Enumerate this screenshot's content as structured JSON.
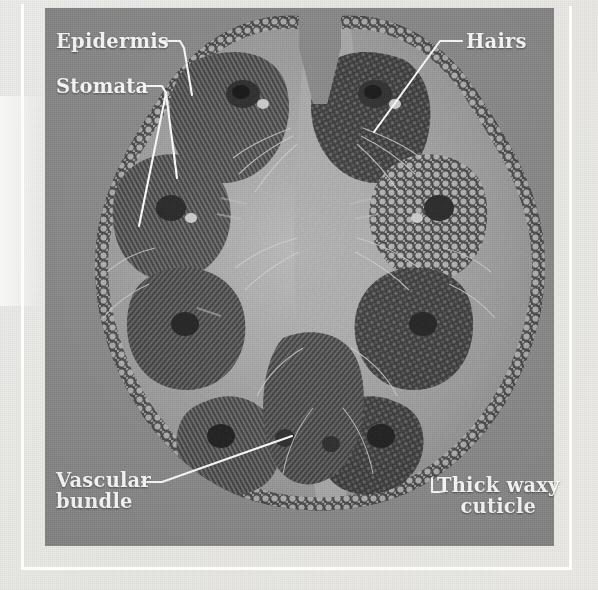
{
  "figure": {
    "medium": "light micrograph",
    "background_color": "#8b8b8b",
    "page_color": "#e9e9e6",
    "frame_color": "#fdfdfb",
    "label_color": "#ffffff"
  },
  "labels": {
    "epidermis": "Epidermis",
    "stomata": "Stomata",
    "hairs": "Hairs",
    "vascular_line1": "Vascular",
    "vascular_line2": "bundle",
    "cuticle_line1": "Thick waxy",
    "cuticle_line2": "cuticle"
  }
}
